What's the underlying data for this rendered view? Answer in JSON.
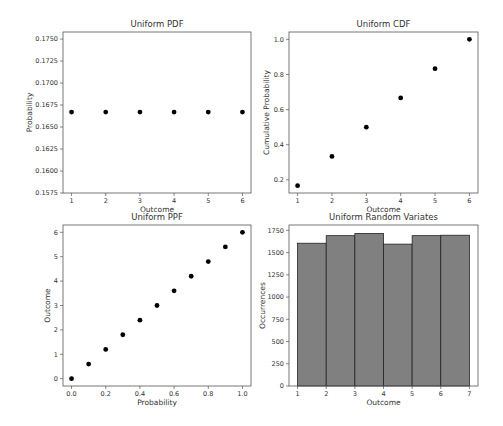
{
  "chart_data": [
    {
      "type": "scatter",
      "title": "Uniform PDF",
      "xlabel": "Outcome",
      "ylabel": "Probability",
      "x": [
        1,
        2,
        3,
        4,
        5,
        6
      ],
      "values": [
        0.1667,
        0.1667,
        0.1667,
        0.1667,
        0.1667,
        0.1667
      ],
      "xlim": [
        0.75,
        6.25
      ],
      "ylim": [
        0.1575,
        0.1758
      ],
      "xticks": [
        "1",
        "2",
        "3",
        "4",
        "5",
        "6"
      ],
      "yticks": [
        "0.1575",
        "0.1600",
        "0.1625",
        "0.1650",
        "0.1675",
        "0.1700",
        "0.1725",
        "0.1750"
      ],
      "grid": false
    },
    {
      "type": "scatter",
      "title": "Uniform CDF",
      "xlabel": "Outcome",
      "ylabel": "Cumulative Probability",
      "x": [
        1,
        2,
        3,
        4,
        5,
        6
      ],
      "values": [
        0.1667,
        0.3333,
        0.5,
        0.6667,
        0.8333,
        1.0
      ],
      "xlim": [
        0.75,
        6.25
      ],
      "ylim": [
        0.125,
        1.042
      ],
      "xticks": [
        "1",
        "2",
        "3",
        "4",
        "5",
        "6"
      ],
      "yticks": [
        "0.2",
        "0.4",
        "0.6",
        "0.8",
        "1.0"
      ],
      "grid": false
    },
    {
      "type": "scatter",
      "title": "Uniform PPF",
      "xlabel": "Probability",
      "ylabel": "Outcome",
      "x": [
        0.0,
        0.1,
        0.2,
        0.3,
        0.4,
        0.5,
        0.6,
        0.7,
        0.8,
        0.9,
        1.0
      ],
      "values": [
        0.0,
        0.6,
        1.2,
        1.8,
        2.4,
        3.0,
        3.6,
        4.2,
        4.8,
        5.4,
        6.0
      ],
      "xlim": [
        -0.05,
        1.05
      ],
      "ylim": [
        -0.3,
        6.3
      ],
      "xticks": [
        "0.0",
        "0.2",
        "0.4",
        "0.6",
        "0.8",
        "1.0"
      ],
      "yticks": [
        "0",
        "1",
        "2",
        "3",
        "4",
        "5",
        "6"
      ],
      "grid": false
    },
    {
      "type": "bar",
      "title": "Uniform Random Variates",
      "xlabel": "Outcome",
      "ylabel": "Occurrences",
      "bin_edges": [
        1,
        2,
        3,
        4,
        5,
        6,
        7
      ],
      "categories": [
        "1-2",
        "2-3",
        "3-4",
        "4-5",
        "5-6",
        "6-7"
      ],
      "values": [
        1605,
        1690,
        1715,
        1595,
        1690,
        1695
      ],
      "xlim": [
        0.7,
        7.3
      ],
      "ylim": [
        0,
        1810
      ],
      "xticks": [
        "1",
        "2",
        "3",
        "4",
        "5",
        "6",
        "7"
      ],
      "yticks": [
        "0",
        "250",
        "500",
        "750",
        "1000",
        "1250",
        "1500",
        "1750"
      ],
      "bar_color": "#808080",
      "edge_color": "#222222",
      "grid": false
    }
  ]
}
